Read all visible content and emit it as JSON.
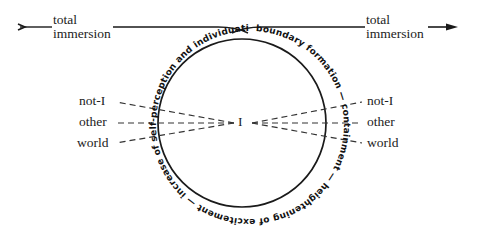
{
  "diagram": {
    "left_label": {
      "line1": "total",
      "line2": "immersion"
    },
    "right_label": {
      "line1": "total",
      "line2": "immersion"
    },
    "center_label": "I",
    "left_items": [
      "not-I",
      "other",
      "world"
    ],
    "right_items": [
      "not-I",
      "other",
      "world"
    ],
    "circle_text": "boundary formation — containment — heightening of excitement — increase of self-perception and individuation.",
    "colors": {
      "line": "#1a1a1a",
      "text": "#222222",
      "background": "#ffffff"
    }
  }
}
